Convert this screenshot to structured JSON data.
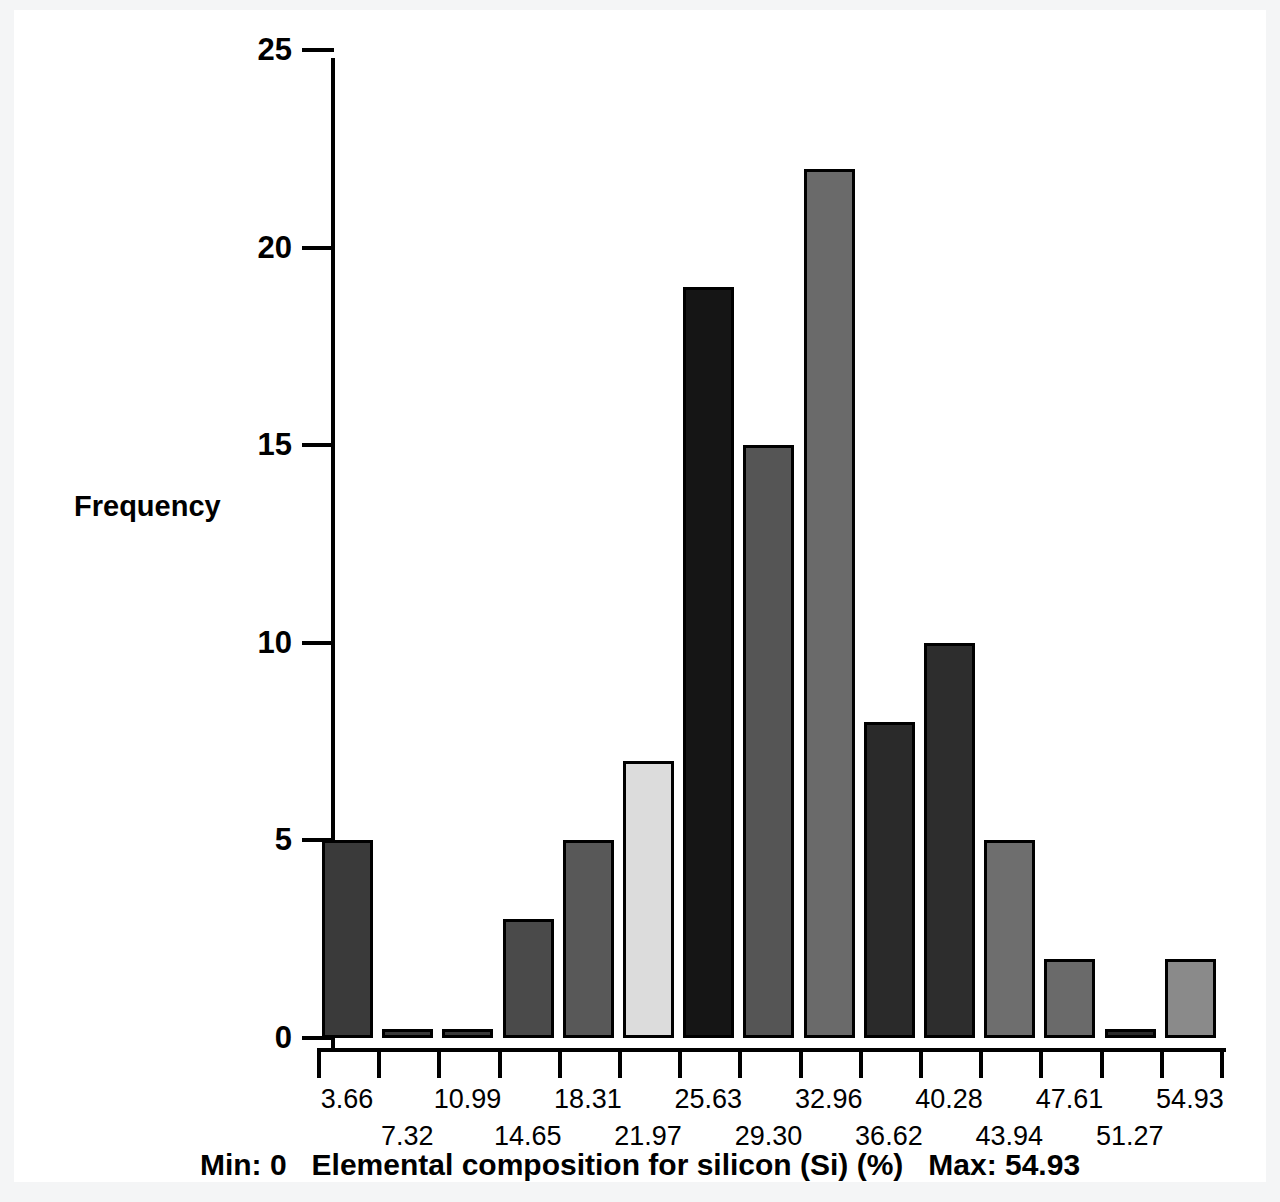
{
  "chart_data": {
    "type": "bar",
    "title": "Min: 0   Elemental composition for silicon (Si) (%)   Max: 54.93",
    "xlabel": "Elemental composition for silicon (Si) (%)",
    "ylabel": "Frequency",
    "xlim": [
      0,
      54.93
    ],
    "ylim": [
      0,
      25
    ],
    "grid": false,
    "legend": null,
    "min_label": "Min: 0",
    "max_label": "Max: 54.93",
    "min_value": 0,
    "max_value": 54.93,
    "y_ticks": [
      0,
      5,
      10,
      15,
      20,
      25
    ],
    "y_tick_labels": [
      "0",
      "5",
      "10",
      "15",
      "20",
      "25"
    ],
    "categories": [
      "3.66",
      "7.32",
      "10.99",
      "14.65",
      "18.31",
      "21.97",
      "25.63",
      "29.30",
      "32.96",
      "36.62",
      "40.28",
      "43.94",
      "47.61",
      "51.27",
      "54.93"
    ],
    "values": [
      5,
      0.2,
      0.2,
      3,
      5,
      7,
      19,
      15,
      22,
      8,
      10,
      5,
      2,
      0.2,
      2
    ],
    "bar_colors": [
      "#3a3a3a",
      "#3a3a3a",
      "#3a3a3a",
      "#4a4a4a",
      "#585858",
      "#dcdcdc",
      "#151515",
      "#555555",
      "#6a6a6a",
      "#2a2a2a",
      "#2d2d2d",
      "#6e6e6e",
      "#6a6a6a",
      "#2a2a2a",
      "#8a8a8a"
    ],
    "bar_edge_color": "#000000",
    "axis_color": "#000000",
    "background_color": "#ffffff"
  },
  "axes": {
    "y_title": "Frequency"
  }
}
